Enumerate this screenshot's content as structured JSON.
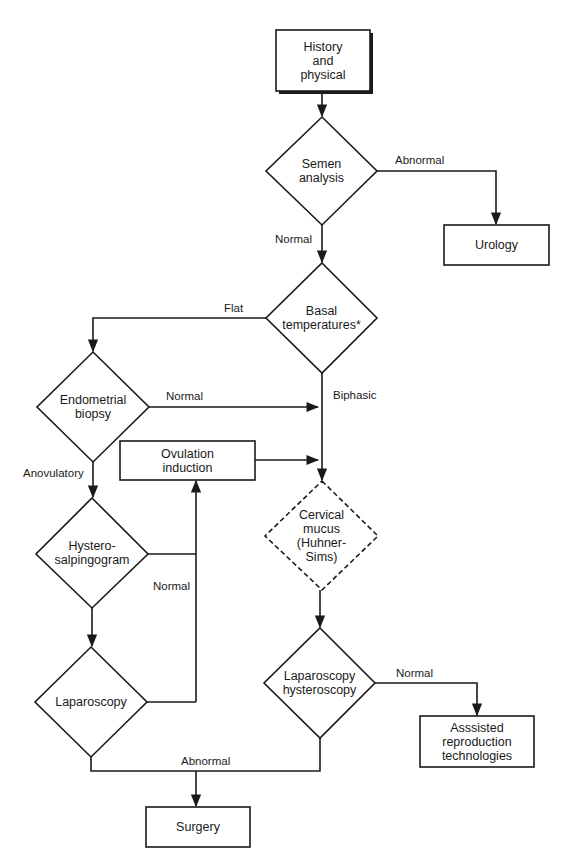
{
  "flowchart": {
    "nodes": {
      "history": {
        "label": "History\nand\nphysical",
        "shape": "box-shadow"
      },
      "semen": {
        "label": "Semen\nanalysis",
        "shape": "diamond"
      },
      "urology": {
        "label": "Urology",
        "shape": "box"
      },
      "basal": {
        "label": "Basal\ntemperatures*",
        "shape": "diamond"
      },
      "endometrial": {
        "label": "Endometrial\nbiopsy",
        "shape": "diamond"
      },
      "ovulation": {
        "label": "Ovulation\ninduction",
        "shape": "box"
      },
      "cervical": {
        "label": "Cervical\nmucus\n(Huhner-\nSims)",
        "shape": "diamond-dashed"
      },
      "hsg": {
        "label": "Hystero-\nsalpingogram",
        "shape": "diamond"
      },
      "laparoscopy": {
        "label": "Laparoscopy",
        "shape": "diamond"
      },
      "laphyst": {
        "label": "Laparoscopy\nhysteroscopy",
        "shape": "diamond"
      },
      "art": {
        "label": "Asssisted\nreproduction\ntechnologies",
        "shape": "box"
      },
      "surgery": {
        "label": "Surgery",
        "shape": "box"
      }
    },
    "edge_labels": {
      "semen_abnormal": "Abnormal",
      "semen_normal": "Normal",
      "basal_flat": "Flat",
      "basal_biphasic": "Biphasic",
      "endo_normal": "Normal",
      "endo_anovulatory": "Anovulatory",
      "hsg_normal": "Normal",
      "laphyst_normal": "Normal",
      "bottom_abnormal": "Abnormal"
    },
    "colors": {
      "stroke": "#1a1a1a",
      "background": "#ffffff"
    }
  }
}
